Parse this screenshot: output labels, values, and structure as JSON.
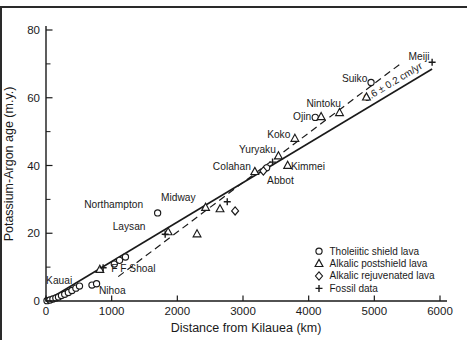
{
  "colors": {
    "ink": "#1a1a1a",
    "background": "#ffffff",
    "frame_rule": "#2a2a2a"
  },
  "figure": {
    "top_border_rule": true,
    "left_border_rule": true
  },
  "chart_data": {
    "type": "scatter",
    "title": "",
    "xlabel": "Distance from Kilauea (km)",
    "ylabel": "Potassium-Argon age (m.y.)",
    "xlim": [
      0,
      6000
    ],
    "ylim": [
      0,
      80
    ],
    "x_ticks": [
      0,
      1000,
      2000,
      3000,
      4000,
      5000,
      6000
    ],
    "y_ticks": [
      0,
      20,
      40,
      60,
      80
    ],
    "y_minor_ticks": [
      10,
      30,
      50,
      70
    ],
    "grid": false,
    "series": [
      {
        "name": "Tholeiitic shield lava",
        "marker": "circle",
        "points": [
          [
            15,
            0.1
          ],
          [
            60,
            0.3
          ],
          [
            105,
            0.6
          ],
          [
            150,
            0.9
          ],
          [
            190,
            1.2
          ],
          [
            235,
            1.6
          ],
          [
            285,
            2.0
          ],
          [
            340,
            2.5
          ],
          [
            395,
            3.1
          ],
          [
            455,
            3.8
          ],
          [
            510,
            4.4
          ],
          [
            700,
            4.7
          ],
          [
            770,
            5.1
          ],
          [
            1040,
            10.9
          ],
          [
            1120,
            12.0
          ],
          [
            1210,
            13.0
          ],
          [
            1700,
            26.0
          ],
          [
            3360,
            39.3
          ],
          [
            4100,
            54.2
          ],
          [
            4950,
            64.5
          ]
        ]
      },
      {
        "name": "Alkalic postshield lava",
        "marker": "triangle",
        "points": [
          [
            820,
            9.3
          ],
          [
            1860,
            20.4
          ],
          [
            2300,
            19.8
          ],
          [
            2430,
            27.6
          ],
          [
            2650,
            27.2
          ],
          [
            3180,
            38.2
          ],
          [
            3540,
            42.8
          ],
          [
            3680,
            40.0
          ],
          [
            3790,
            48.0
          ],
          [
            4190,
            54.4
          ],
          [
            4470,
            55.6
          ],
          [
            4880,
            60.2
          ]
        ]
      },
      {
        "name": "Alkalic rejuvenated lava",
        "marker": "diamond",
        "points": [
          [
            2880,
            26.6
          ],
          [
            3310,
            38.4
          ]
        ]
      },
      {
        "name": "Fossil data",
        "marker": "cross",
        "points": [
          [
            870,
            9.8
          ],
          [
            1815,
            19.7
          ],
          [
            2760,
            29.3
          ],
          [
            3450,
            41.0
          ],
          [
            5880,
            70.5
          ]
        ]
      }
    ],
    "trend_lines": [
      {
        "style": "solid",
        "from": [
          0,
          0
        ],
        "to": [
          5880,
          68.5
        ]
      },
      {
        "style": "dashed",
        "from": [
          1100,
          7.2
        ],
        "to": [
          5430,
          70.5
        ]
      }
    ],
    "rate_label": {
      "text": "8.6 ± 0.2 cm/yr",
      "x": 5310,
      "y": 63.8,
      "rotation": -31
    },
    "point_labels": [
      {
        "text": "Kauai",
        "x": 200,
        "y": 6.0
      },
      {
        "text": "Nihoa",
        "x": 1010,
        "y": 3.2
      },
      {
        "text": "F F Shoal",
        "x": 1330,
        "y": 9.5
      },
      {
        "text": "Laysan",
        "x": 1265,
        "y": 22.0
      },
      {
        "text": "Northampton",
        "x": 1030,
        "y": 28.5
      },
      {
        "text": "Midway",
        "x": 2015,
        "y": 30.5
      },
      {
        "text": "Colahan",
        "x": 2830,
        "y": 39.8
      },
      {
        "text": "Abbot",
        "x": 3570,
        "y": 35.5
      },
      {
        "text": "Yuryaku",
        "x": 3220,
        "y": 44.6
      },
      {
        "text": "Koko",
        "x": 3545,
        "y": 49.2
      },
      {
        "text": "Kimmei",
        "x": 3990,
        "y": 39.8
      },
      {
        "text": "Ojin",
        "x": 3900,
        "y": 54.5
      },
      {
        "text": "Nintoku",
        "x": 4230,
        "y": 58.3
      },
      {
        "text": "Suiko",
        "x": 4700,
        "y": 65.8
      },
      {
        "text": "Meiji",
        "x": 5680,
        "y": 72.3
      }
    ],
    "legend": {
      "position": "lower-right",
      "items": [
        {
          "marker": "circle",
          "label": "Tholeiitic shield lava"
        },
        {
          "marker": "triangle",
          "label": "Alkalic postshield lava"
        },
        {
          "marker": "diamond",
          "label": "Alkalic rejuvenated lava"
        },
        {
          "marker": "cross",
          "label": "Fossil data"
        }
      ]
    }
  }
}
